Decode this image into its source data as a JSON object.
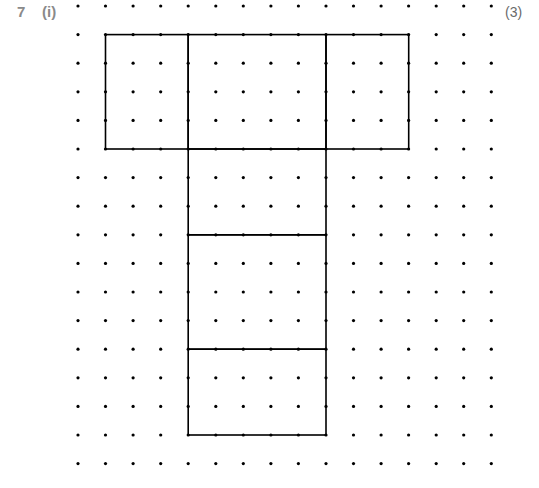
{
  "question": {
    "number": "7",
    "part": "(i)",
    "marks": "(3)"
  },
  "grid": {
    "columns": 16,
    "rows": 17,
    "origin_x": 78,
    "origin_y": 6,
    "spacing_x": 27.55,
    "spacing_y": 28.6,
    "dot_color": "#000000",
    "line_color": "#000000"
  },
  "net": {
    "description": "Net of a cuboid drawn on isometric-free square dot grid",
    "rectangles": [
      {
        "name": "top-left-face",
        "col": 1,
        "row": 1,
        "w": 3,
        "h": 4
      },
      {
        "name": "top-middle-face",
        "col": 4,
        "row": 1,
        "w": 5,
        "h": 4
      },
      {
        "name": "top-right-face",
        "col": 9,
        "row": 1,
        "w": 3,
        "h": 4
      },
      {
        "name": "stem-face-1",
        "col": 4,
        "row": 5,
        "w": 5,
        "h": 3
      },
      {
        "name": "stem-face-2",
        "col": 4,
        "row": 8,
        "w": 5,
        "h": 4
      },
      {
        "name": "stem-face-3",
        "col": 4,
        "row": 12,
        "w": 5,
        "h": 3
      }
    ]
  }
}
